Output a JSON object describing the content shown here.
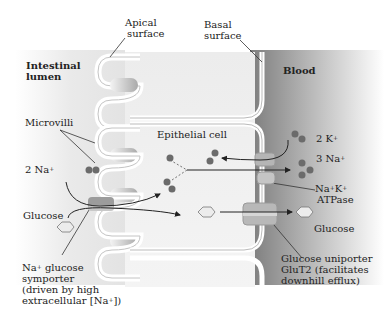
{
  "figure": {
    "regions": {
      "lumen": "Intestinal lumen",
      "lumen_line1": "Intestinal",
      "lumen_line2": "lumen",
      "blood": "Blood",
      "cell": "Epithelial cell"
    },
    "surfaces": {
      "apical_line1": "Apical",
      "apical_line2": "surface",
      "basal_line1": "Basal",
      "basal_line2": "surface"
    },
    "structures": {
      "microvilli": "Microvilli"
    },
    "ions": {
      "na_in": "2 Na",
      "na_in_sup": "+",
      "k_blood": "2 K",
      "k_blood_sup": "+",
      "na_blood": "3 Na",
      "na_blood_sup": "+"
    },
    "molecules": {
      "glucose_lumen": "Glucose",
      "glucose_blood": "Glucose"
    },
    "transporters": {
      "symporter_line1_pre": "Na",
      "symporter_line1_sup": "+",
      "symporter_line1_post": " glucose",
      "symporter_line2": "symporter",
      "symporter_line3": "(driven by high",
      "symporter_line4_pre": "extracellular [Na",
      "symporter_line4_sup": "+",
      "symporter_line4_post": "])",
      "atpase_line1_a": "Na",
      "atpase_line1_sup1": "+",
      "atpase_line1_b": "K",
      "atpase_line1_sup2": "+",
      "atpase_line2": "ATPase",
      "uniporter_line1": "Glucose uniporter",
      "uniporter_line2": "GluT2 (facilitates",
      "uniporter_line3": "downhill efflux)"
    },
    "colors": {
      "ion_dot": "#6b6b6b",
      "membrane_fill": "#ffffff",
      "lumen_bg": "#ececec",
      "blood_bg": "#9a9a9a",
      "transporter": "#b5b5b5"
    }
  }
}
